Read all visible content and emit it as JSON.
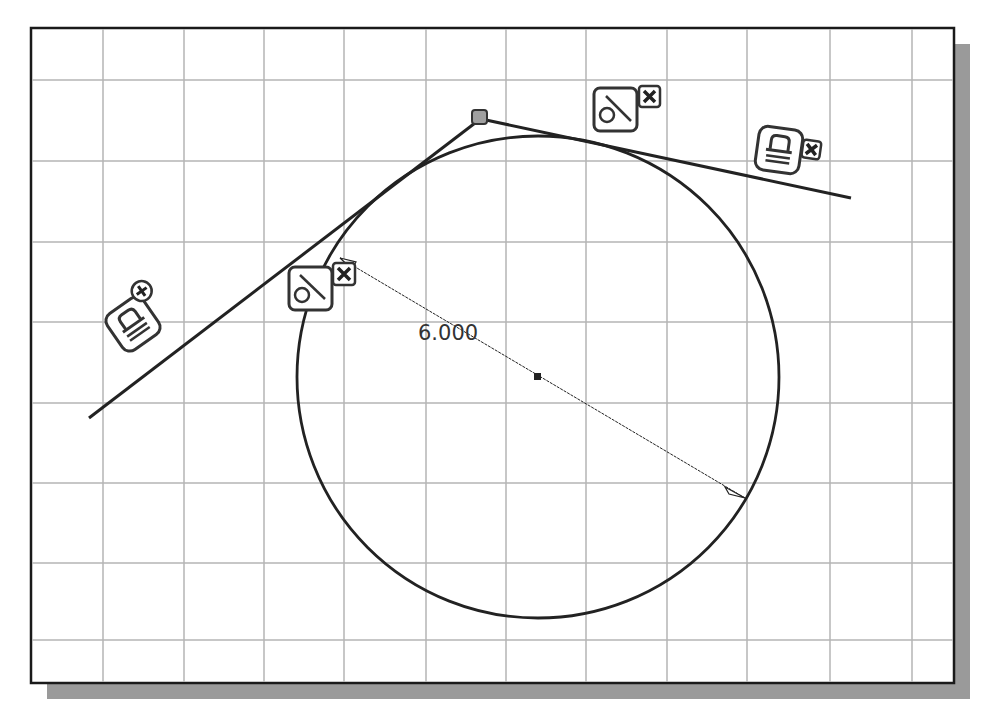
{
  "sketch": {
    "frame": {
      "x": 31,
      "y": 28,
      "width": 923,
      "height": 655,
      "border_color": "#1a1a1a",
      "shadow_color": "#9a9a9a",
      "shadow_offset": 16
    },
    "grid": {
      "color": "#b4b4b4",
      "vertical_x": [
        103,
        184,
        264,
        344,
        426,
        506,
        586,
        667,
        747,
        830,
        912
      ],
      "horizontal_y": [
        80,
        161,
        242,
        322,
        403,
        483,
        563,
        640
      ]
    },
    "circle": {
      "cx": 538,
      "cy": 377,
      "r": 241,
      "center_mark": true
    },
    "lines": [
      {
        "name": "left-tangent-line",
        "x1": 89,
        "y1": 418,
        "x2": 479,
        "y2": 120
      },
      {
        "name": "right-tangent-line",
        "x1": 486,
        "y1": 120,
        "x2": 851,
        "y2": 198
      }
    ],
    "vertex_point": {
      "x": 480,
      "y": 118
    },
    "dimension": {
      "type": "diameter",
      "value_label": "6.000",
      "x1": 340,
      "y1": 258,
      "x2": 745,
      "y2": 498,
      "label_x": 418,
      "label_y": 340
    },
    "constraints": [
      {
        "type": "tangent",
        "icon": "tangent-icon",
        "x": 289,
        "y": 267,
        "delete_icon": "delete-x-icon"
      },
      {
        "type": "tangent",
        "icon": "tangent-icon",
        "x": 594,
        "y": 88,
        "delete_icon": "delete-x-icon"
      },
      {
        "type": "fix",
        "icon": "fix-lock-icon",
        "x": 110,
        "y": 296,
        "delete_icon": "delete-x-icon"
      },
      {
        "type": "fix",
        "icon": "fix-lock-icon",
        "x": 756,
        "y": 128,
        "delete_icon": "delete-x-icon"
      }
    ]
  }
}
